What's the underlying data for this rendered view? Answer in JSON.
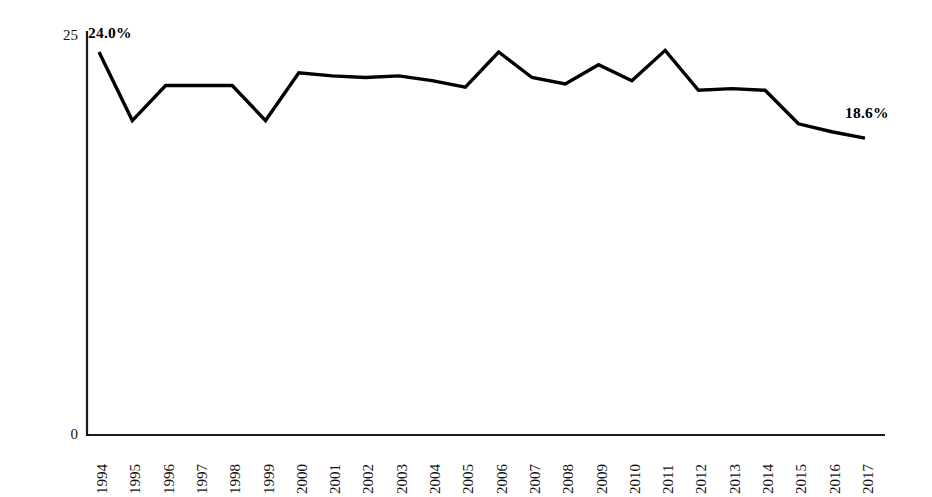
{
  "chart_data": {
    "type": "line",
    "title": "",
    "subtitle": "",
    "xlabel": "",
    "ylabel": "Pecentage of Fatal Crashes Involving a Teen Driver",
    "ylim": [
      0,
      25
    ],
    "y_ticks": [
      "0",
      "25"
    ],
    "y_tick_values": [
      0,
      25
    ],
    "grid": false,
    "legend": null,
    "legend_position": "none",
    "line_color": "#000000",
    "categories": [
      "1994",
      "1995",
      "1996",
      "1997",
      "1998",
      "1999",
      "2000",
      "2001",
      "2002",
      "2003",
      "2004",
      "2005",
      "2006",
      "2007",
      "2008",
      "2009",
      "2010",
      "2011",
      "2012",
      "2013",
      "2014",
      "2015",
      "2016",
      "2017"
    ],
    "values": [
      24.0,
      19.7,
      21.9,
      21.9,
      21.9,
      19.7,
      22.7,
      22.5,
      22.4,
      22.5,
      22.2,
      21.8,
      24.0,
      22.4,
      22.0,
      23.2,
      22.2,
      24.1,
      21.6,
      21.7,
      21.6,
      19.5,
      19.0,
      18.6
    ],
    "annotations": [
      {
        "label": "24.0%",
        "category": "1994",
        "value": 24.0
      },
      {
        "label": "18.6%",
        "category": "2017",
        "value": 18.6
      }
    ]
  },
  "axes": {
    "y_title": "Pecentage of Fatal Crashes Involving a Teen Driver",
    "y_tick_top": "25",
    "y_tick_bottom": "0"
  },
  "annotations": {
    "start_label": "24.0%",
    "end_label": "18.6%"
  }
}
